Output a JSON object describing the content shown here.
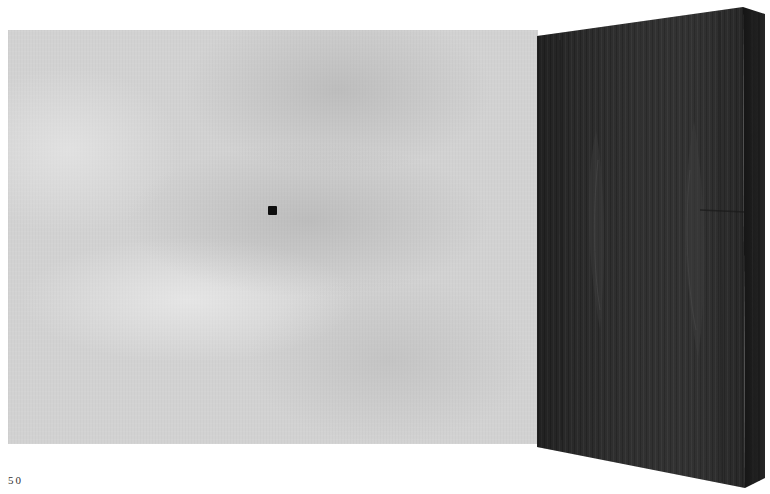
{
  "page": {
    "number": "50"
  },
  "artwork": {
    "elements": [
      {
        "name": "gray-wall-panel",
        "description": "light gray mottled plaster panel"
      },
      {
        "name": "black-square",
        "description": "small black square mark on gray panel"
      },
      {
        "name": "wood-slab",
        "description": "dark wood-grain slab shown in perspective with front and side faces"
      }
    ]
  },
  "colors": {
    "background": "#ffffff",
    "gray_panel": "#d2d2d2",
    "black_square": "#0e0e0e",
    "wood_front": "#2a2a2a",
    "wood_side": "#1c1c1c",
    "page_number_text": "#333333"
  }
}
